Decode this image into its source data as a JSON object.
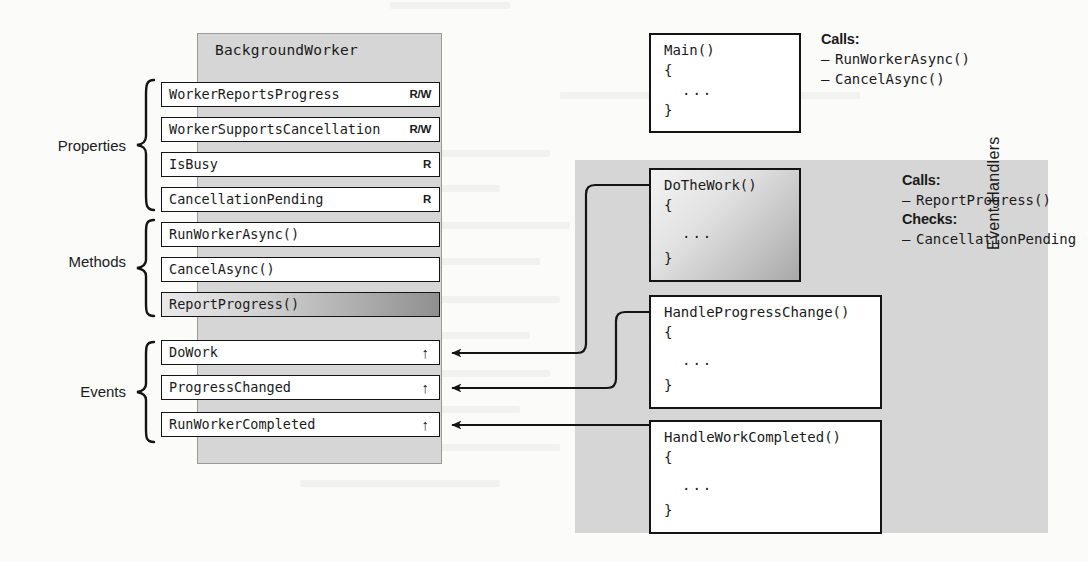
{
  "class_panel": {
    "title": "BackgroundWorker",
    "groups": [
      {
        "caption": "Properties",
        "rows": [
          {
            "name": "WorkerReportsProgress",
            "access": "R/W",
            "arrow": "",
            "gradient": false
          },
          {
            "name": "WorkerSupportsCancellation",
            "access": "R/W",
            "arrow": "",
            "gradient": false
          },
          {
            "name": "IsBusy",
            "access": "R",
            "arrow": "",
            "gradient": false
          },
          {
            "name": "CancellationPending",
            "access": "R",
            "arrow": "",
            "gradient": false
          }
        ]
      },
      {
        "caption": "Methods",
        "rows": [
          {
            "name": "RunWorkerAsync()",
            "access": "",
            "arrow": "",
            "gradient": false
          },
          {
            "name": "CancelAsync()",
            "access": "",
            "arrow": "",
            "gradient": false
          },
          {
            "name": "ReportProgress()",
            "access": "",
            "arrow": "",
            "gradient": true
          }
        ]
      },
      {
        "caption": "Events",
        "rows": [
          {
            "name": "DoWork",
            "access": "",
            "arrow": "↑",
            "gradient": false
          },
          {
            "name": "ProgressChanged",
            "access": "",
            "arrow": "↑",
            "gradient": false
          },
          {
            "name": "RunWorkerCompleted",
            "access": "",
            "arrow": "↑",
            "gradient": false
          }
        ]
      }
    ]
  },
  "handlers_panel": {
    "label": "Event Handlers"
  },
  "code_blocks": [
    {
      "signature": "Main()",
      "open": "{",
      "body": "...",
      "close": "}",
      "gradient": false
    },
    {
      "signature": "DoTheWork()",
      "open": "{",
      "body": "...",
      "close": "}",
      "gradient": true
    },
    {
      "signature": "HandleProgressChange()",
      "open": "{",
      "body": "...",
      "close": "}",
      "gradient": false
    },
    {
      "signature": "HandleWorkCompleted()",
      "open": "{",
      "body": "...",
      "close": "}",
      "gradient": false
    }
  ],
  "annotations": [
    {
      "sections": [
        {
          "heading": "Calls:",
          "items": [
            "RunWorkerAsync()",
            "CancelAsync()"
          ]
        }
      ]
    },
    {
      "sections": [
        {
          "heading": "Calls:",
          "items": [
            "ReportProgress()"
          ]
        },
        {
          "heading": "Checks:",
          "items": [
            "CancellationPending"
          ]
        }
      ]
    }
  ],
  "bullet_dash": "–",
  "colors": {
    "panel_gray": "#d6d6d6",
    "box_border": "#141414",
    "box_fill": "#ffffff",
    "page_bg": "#fbfbfa"
  }
}
